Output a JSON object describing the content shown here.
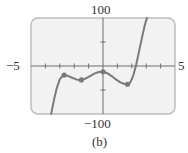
{
  "chart_data": {
    "type": "line",
    "title": "",
    "caption": "(b)",
    "xlabel": "",
    "ylabel": "",
    "xlim": [
      -5,
      5
    ],
    "ylim": [
      -100,
      100
    ],
    "x_range_labels": {
      "min": "−5",
      "max": "5"
    },
    "y_range_labels": {
      "min": "−100",
      "max": "100"
    },
    "x_ticks": [
      -4,
      -3,
      -2,
      -1,
      0,
      1,
      2,
      3,
      4
    ],
    "y_ticks": [
      -50,
      50
    ],
    "grid": false,
    "legend": null,
    "series": [
      {
        "name": "polynomial",
        "color": "#7a7a7a",
        "x": [
          -3.6,
          -3.4,
          -3.2,
          -3.0,
          -2.85,
          -2.7,
          -2.4,
          -2.1,
          -1.8,
          -1.5,
          -1.2,
          -0.9,
          -0.6,
          -0.3,
          0.0,
          0.3,
          0.6,
          0.9,
          1.2,
          1.5,
          1.7,
          1.9,
          2.1,
          2.3,
          2.5,
          2.7,
          2.9,
          3.05
        ],
        "y": [
          -100,
          -70,
          -45,
          -28,
          -22,
          -19,
          -21,
          -25,
          -28.5,
          -29,
          -26,
          -21,
          -16,
          -12.5,
          -12,
          -15,
          -21,
          -28,
          -34,
          -37.5,
          -38,
          -34,
          -20,
          2,
          30,
          58,
          85,
          100
        ]
      }
    ],
    "marked_points": [
      {
        "x": -2.7,
        "y": -19
      },
      {
        "x": -1.5,
        "y": -29
      },
      {
        "x": 0.0,
        "y": -12
      },
      {
        "x": 1.7,
        "y": -38
      }
    ]
  },
  "labels": {
    "x_min": "−5",
    "x_max": "5",
    "y_max": "100",
    "y_min": "−100",
    "caption": "(b)"
  },
  "colors": {
    "box_fill": "#f2f2f2",
    "box_border": "#bdbdbd",
    "axis": "#6e6e6e",
    "curve": "#7a7a7a",
    "point": "#7a7a7a"
  }
}
